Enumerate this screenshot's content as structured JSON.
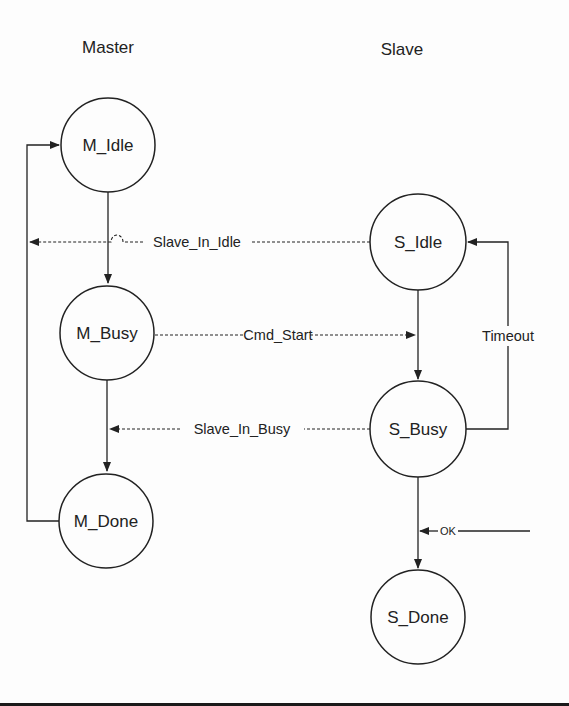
{
  "columns": {
    "master": "Master",
    "slave": "Slave"
  },
  "states": {
    "m_idle": "M_Idle",
    "m_busy": "M_Busy",
    "m_done": "M_Done",
    "s_idle": "S_Idle",
    "s_busy": "S_Busy",
    "s_done": "S_Done"
  },
  "transitions": {
    "slave_in_idle": "Slave_In_Idle",
    "cmd_start": "Cmd_Start",
    "slave_in_busy": "Slave_In_Busy",
    "timeout": "Timeout",
    "ok": "OK"
  },
  "colors": {
    "line": "#222222",
    "background": "#fdfdfd"
  }
}
